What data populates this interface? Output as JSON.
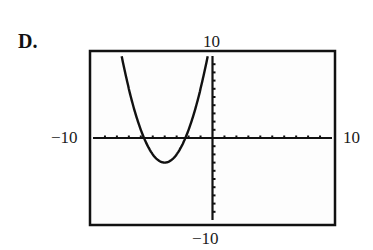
{
  "choice_label": "D.",
  "chart_data": {
    "type": "line",
    "title": "",
    "function": "y = (x + 4)^2 - 3",
    "xlabel": "",
    "ylabel": "",
    "xlim": [
      -10,
      10
    ],
    "ylim": [
      -10,
      10
    ],
    "xscale_ticks": 1,
    "yscale_ticks": 1,
    "grid": false,
    "legend": null,
    "window_labels": {
      "ymax": "10",
      "ymin": "−10",
      "xmin": "−10",
      "xmax": "10"
    },
    "features": {
      "vertex": [
        -4,
        -3
      ],
      "x_intercepts": [
        -5.73,
        -2.27
      ],
      "y_intercept": 13,
      "opens": "up"
    },
    "series": [
      {
        "name": "parabola",
        "x": [
          -7.6,
          -7,
          -6.5,
          -6,
          -5.73,
          -5.5,
          -5,
          -4.5,
          -4,
          -3.5,
          -3,
          -2.5,
          -2.27,
          -2,
          -1.5,
          -1,
          -0.4
        ],
        "y": [
          9.96,
          6,
          3.25,
          1,
          0,
          -0.75,
          -2,
          -2.75,
          -3,
          -2.75,
          -2,
          -0.75,
          0,
          1,
          3.25,
          6,
          9.96
        ]
      }
    ]
  }
}
